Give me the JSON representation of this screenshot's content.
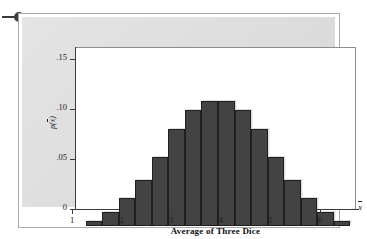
{
  "figure": {
    "bullet_marker": "list-bullet",
    "axis_title_x": "Average of Three Dice",
    "axis_title_y_prefix": "p(",
    "axis_title_y_var": "x",
    "axis_title_y_suffix": ")",
    "x_end_symbol": "x"
  },
  "chart_data": {
    "type": "bar",
    "title": "",
    "subtitle": "",
    "xlabel": "Average of Three Dice",
    "ylabel": "p(x̄)",
    "xlim": [
      0.8333,
      6.1667
    ],
    "ylim": [
      0,
      0.16
    ],
    "grid": false,
    "legend": null,
    "bar_color": "#434343",
    "bar_edge_color": "#1f1f1f",
    "panel_color": "#dedede",
    "plot_bg_color": "#ffffff",
    "axis_color": "#3b3b3b",
    "x_tick_labels": [
      "1",
      "2",
      "3",
      "4",
      "5",
      "6"
    ],
    "x_tick_values": [
      1,
      2,
      3,
      4,
      5,
      6
    ],
    "y_tick_labels": [
      "0",
      ".05",
      ".10",
      ".15"
    ],
    "y_tick_values": [
      0,
      0.05,
      0.1,
      0.15
    ],
    "bar_width": 0.3333,
    "categories": [
      "1.00",
      "1.33",
      "1.67",
      "2.00",
      "2.33",
      "2.67",
      "3.00",
      "3.33",
      "3.67",
      "4.00",
      "4.33",
      "4.67",
      "5.00",
      "5.33",
      "5.67",
      "6.00"
    ],
    "x": [
      1.0,
      1.3333,
      1.6667,
      2.0,
      2.3333,
      2.6667,
      3.0,
      3.3333,
      3.6667,
      4.0,
      4.3333,
      4.6667,
      5.0,
      5.3333,
      5.6667,
      6.0
    ],
    "values": [
      0.00463,
      0.01389,
      0.02778,
      0.0463,
      0.06944,
      0.09722,
      0.11574,
      0.125,
      0.125,
      0.11574,
      0.09722,
      0.06944,
      0.0463,
      0.02778,
      0.01389,
      0.00463
    ],
    "counts_out_of_216": [
      1,
      3,
      6,
      10,
      15,
      21,
      25,
      27,
      27,
      25,
      21,
      15,
      10,
      6,
      3,
      1
    ],
    "annotations": []
  }
}
